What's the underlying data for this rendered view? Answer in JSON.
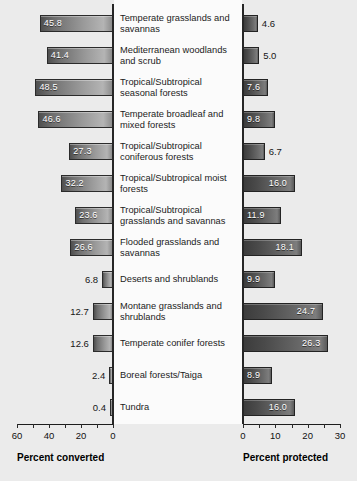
{
  "chart_data": {
    "type": "bar",
    "orientation": "horizontal",
    "layout": "back-to-back paired panels",
    "title": "",
    "categories": [
      "Temperate grasslands and savannas",
      "Mediterranean woodlands and scrub",
      "Tropical/Subtropical seasonal forests",
      "Temperate broadleaf and mixed forests",
      "Tropical/Subtropical coniferous forests",
      "Tropical/Subtropical moist forests",
      "Tropical/Subtropical grasslands and savannas",
      "Flooded grasslands and savannas",
      "Deserts and shrublands",
      "Montane grasslands and shrublands",
      "Temperate conifer forests",
      "Boreal forests/Taiga",
      "Tundra"
    ],
    "series": [
      {
        "name": "Percent converted",
        "panel": "left",
        "axis_direction": "reversed",
        "xlabel": "Percent converted",
        "xlim": [
          0,
          60
        ],
        "ticks": [
          60,
          40,
          20,
          0
        ],
        "minor_tick_step": 10,
        "values": [
          45.8,
          41.4,
          48.5,
          46.6,
          27.3,
          32.2,
          23.6,
          26.6,
          6.8,
          12.7,
          12.6,
          2.4,
          0.4
        ]
      },
      {
        "name": "Percent protected",
        "panel": "right",
        "axis_direction": "normal",
        "xlabel": "Percent protected",
        "xlim": [
          0,
          30
        ],
        "ticks": [
          0,
          10,
          20,
          30
        ],
        "minor_tick_step": 5,
        "values": [
          4.6,
          5.0,
          7.6,
          9.8,
          6.7,
          16.0,
          11.9,
          18.1,
          9.9,
          24.7,
          26.3,
          8.9,
          16.0
        ]
      }
    ],
    "grid": false,
    "legend": "none",
    "colors": {
      "background": "#ebebeb",
      "label_panel": "#fbfbfb",
      "bar_left_dark": "#4f4f4f",
      "bar_left_light": "#b4b4b4",
      "bar_right_dark": "#3c3c3c",
      "bar_right_light": "#7d7d7d",
      "axis": "#1d1d1d",
      "text": "#161616",
      "value_text_inside": "#ffffff"
    }
  },
  "left_axis": {
    "title": "Percent converted",
    "tick_labels": [
      "60",
      "40",
      "20",
      "0"
    ]
  },
  "right_axis": {
    "title": "Percent protected",
    "tick_labels": [
      "0",
      "10",
      "20",
      "30"
    ]
  },
  "left_values": [
    "45.8",
    "41.4",
    "48.5",
    "46.6",
    "27.3",
    "32.2",
    "23.6",
    "26.6",
    "6.8",
    "12.7",
    "12.6",
    "2.4",
    "0.4"
  ],
  "right_values": [
    "4.6",
    "5.0",
    "7.6",
    "9.8",
    "6.7",
    "16.0",
    "11.9",
    "18.1",
    "9.9",
    "24.7",
    "26.3",
    "8.9",
    "16.0"
  ],
  "categories": [
    "Temperate grasslands and savannas",
    "Mediterranean woodlands and scrub",
    "Tropical/Subtropical seasonal forests",
    "Temperate broadleaf and mixed forests",
    "Tropical/Subtropical coniferous forests",
    "Tropical/Subtropical moist forests",
    "Tropical/Subtropical grasslands and savannas",
    "Flooded grasslands and savannas",
    "Deserts and shrublands",
    "Montane grasslands and shrublands",
    "Temperate conifer forests",
    "Boreal forests/Taiga",
    "Tundra"
  ]
}
